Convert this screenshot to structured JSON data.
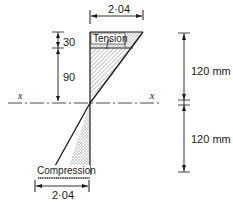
{
  "diagram": {
    "top_width_label": "2·04",
    "bottom_width_label": "2·04",
    "tension_label": "Tension",
    "compression_label": "Compression",
    "stress_label": "f'",
    "dim_upper_small": "30",
    "dim_upper_large": "90",
    "axis_label_left": "x",
    "axis_label_right": "x",
    "height_upper": "120 mm",
    "height_lower": "120 mm",
    "colors": {
      "line": "#1a1a1a",
      "hatch": "#9a9a9a",
      "background": "#ffffff"
    }
  }
}
